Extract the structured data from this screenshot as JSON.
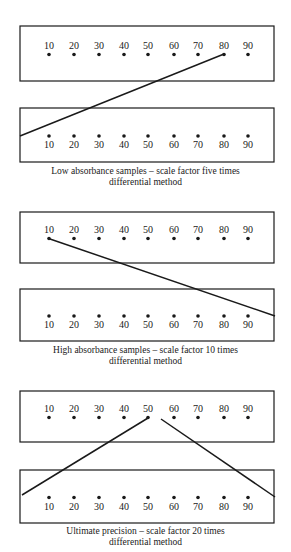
{
  "scale_values": [
    "10",
    "20",
    "30",
    "40",
    "50",
    "60",
    "70",
    "80",
    "90"
  ],
  "dot_x": [
    49,
    74,
    99,
    124,
    148,
    174,
    198,
    224,
    248
  ],
  "colors": {
    "ink": "#1a1a1a",
    "background": "#ffffff"
  },
  "panels": [
    {
      "id": "low-absorbance",
      "caption_line1": "Low absorbance samples – scale factor five times",
      "caption_line2": "differential method",
      "upper_box": {
        "top": 26,
        "bottom": 81
      },
      "lower_box": {
        "top": 108,
        "bottom": 162
      },
      "lines": [
        {
          "from": [
            20,
            136
          ],
          "to": [
            224,
            54
          ]
        }
      ],
      "caption_top": 166
    },
    {
      "id": "high-absorbance",
      "caption_line1": "High absorbance samples – scale factor 10 times",
      "caption_line2": "differential method",
      "upper_box": {
        "top": 212,
        "bottom": 263
      },
      "lower_box": {
        "top": 289,
        "bottom": 341
      },
      "lines": [
        {
          "from": [
            50,
            239
          ],
          "to": [
            275,
            316
          ]
        }
      ],
      "caption_top": 345
    },
    {
      "id": "ultimate-precision",
      "caption_line1": "Ultimate precision – scale factor 20 times",
      "caption_line2": "differential method",
      "upper_box": {
        "top": 391,
        "bottom": 442
      },
      "lower_box": {
        "top": 470,
        "bottom": 523
      },
      "lines": [
        {
          "from": [
            22,
            495
          ],
          "to": [
            148,
            418
          ]
        },
        {
          "from": [
            161,
            419
          ],
          "to": [
            275,
            497
          ]
        }
      ],
      "caption_top": 526
    }
  ]
}
